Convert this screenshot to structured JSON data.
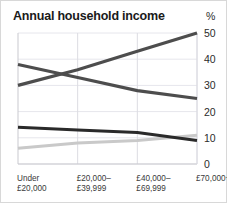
{
  "card": {
    "title": "Annual household income",
    "unit_label": "%"
  },
  "chart_data": {
    "type": "line",
    "title": "Annual household income",
    "xlabel": "",
    "ylabel": "%",
    "ylim": [
      0,
      50
    ],
    "yticks": [
      0,
      10,
      20,
      30,
      40,
      50
    ],
    "ytick_labels": [
      "0",
      "10",
      "20",
      "30",
      "40",
      "50"
    ],
    "grid": true,
    "legend": "none",
    "categories": [
      "Under\n£20,000",
      "£20,000–\n£39,999",
      "£40,000–\n£69,999",
      "£70,000+"
    ],
    "category_lines": [
      [
        "Under",
        "£20,000"
      ],
      [
        "£20,000–",
        "£39,999"
      ],
      [
        "£40,000–",
        "£69,999"
      ],
      [
        "£70,000+",
        ""
      ]
    ],
    "series": [
      {
        "name": "series-rising",
        "color": "#4d4d4d",
        "width": 3.2,
        "values": [
          30,
          36,
          43,
          50
        ]
      },
      {
        "name": "series-falling",
        "color": "#4d4d4d",
        "width": 3.2,
        "values": [
          38,
          33,
          28,
          25
        ]
      },
      {
        "name": "series-low-falling",
        "color": "#2a2a2a",
        "width": 3.0,
        "values": [
          14,
          13,
          12,
          9
        ]
      },
      {
        "name": "series-low-rising",
        "color": "#c9c9c9",
        "width": 3.0,
        "values": [
          6,
          8,
          9,
          11
        ]
      }
    ]
  },
  "axis_geometry": {
    "plot_left": 17,
    "plot_right": 196,
    "plot_top": 32,
    "plot_bottom": 163
  }
}
